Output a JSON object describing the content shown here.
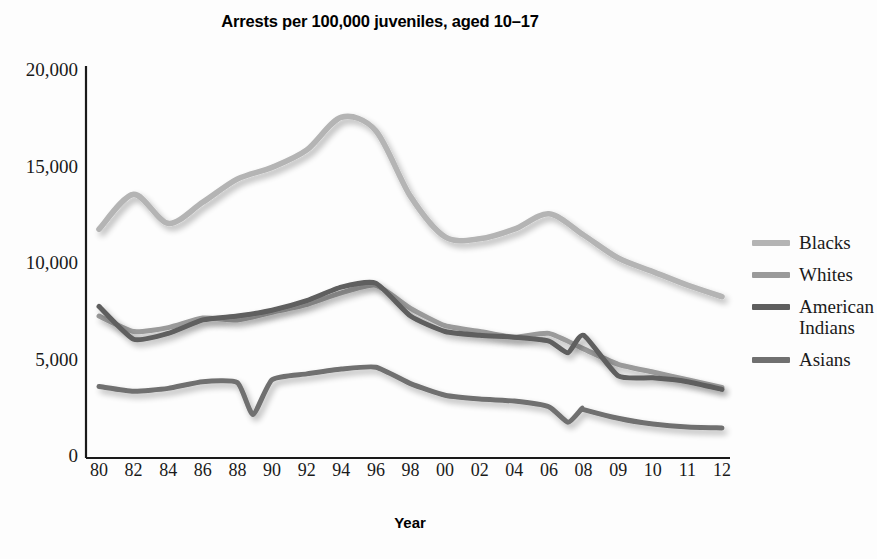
{
  "chart_data": {
    "type": "line",
    "title": "Arrests per 100,000 juveniles, aged 10–17",
    "xlabel": "Year",
    "ylabel": "",
    "grid": false,
    "legend_position": "right",
    "ylim": [
      0,
      20000
    ],
    "yticks": [
      0,
      5000,
      10000,
      15000,
      20000
    ],
    "ytick_labels": [
      "0",
      "5,000",
      "10,000",
      "15,000",
      "20,000"
    ],
    "categories": [
      "80",
      "82",
      "84",
      "86",
      "88",
      "90",
      "92",
      "94",
      "96",
      "98",
      "00",
      "02",
      "04",
      "06",
      "08",
      "09",
      "10",
      "11",
      "12"
    ],
    "x": [
      1980,
      1982,
      1984,
      1986,
      1988,
      1990,
      1992,
      1994,
      1996,
      1998,
      2000,
      2002,
      2004,
      2006,
      2008,
      2009,
      2010,
      2011,
      2012
    ],
    "series": [
      {
        "name": "Blacks",
        "color": "#b4b4b4",
        "values": [
          11700,
          13500,
          12000,
          13100,
          14300,
          14900,
          15800,
          17500,
          16800,
          13400,
          11300,
          11200,
          11700,
          12500,
          11400,
          10200,
          9500,
          8800,
          8200
        ]
      },
      {
        "name": "Whites",
        "color": "#9a9a9a",
        "values": [
          7200,
          6400,
          6600,
          7100,
          7000,
          7400,
          7800,
          8400,
          8800,
          7600,
          6700,
          6400,
          6100,
          6300,
          5500,
          4700,
          4300,
          3900,
          3500
        ]
      },
      {
        "name": "American Indians",
        "color": "#5e5e5e",
        "values": [
          7700,
          6000,
          6300,
          7000,
          7200,
          7500,
          8000,
          8700,
          8900,
          7200,
          6400,
          6200,
          6100,
          5900,
          6200,
          4100,
          4000,
          3800,
          3400
        ]
      },
      {
        "name": "Asians",
        "color": "#707070",
        "values": [
          3550,
          3300,
          3450,
          3800,
          3750,
          3900,
          4200,
          4450,
          4550,
          3700,
          3100,
          2900,
          2800,
          2500,
          2350,
          1900,
          1600,
          1450,
          1400
        ]
      }
    ],
    "annotations": {
      "note_dip_1989": "Sharp dip in Asians series near 1989 to about 2,100",
      "note_dip_2007": "Dip in Asians series near 2007 to about 1,700",
      "note_dip_2007_ai": "Dip in American Indians series near 2007 to about 5,300"
    }
  },
  "legend": {
    "items": [
      {
        "label": "Blacks",
        "color": "#b4b4b4"
      },
      {
        "label": "Whites",
        "color": "#9a9a9a"
      },
      {
        "label": "American\nIndians",
        "color": "#5e5e5e"
      },
      {
        "label": "Asians",
        "color": "#707070"
      }
    ]
  }
}
